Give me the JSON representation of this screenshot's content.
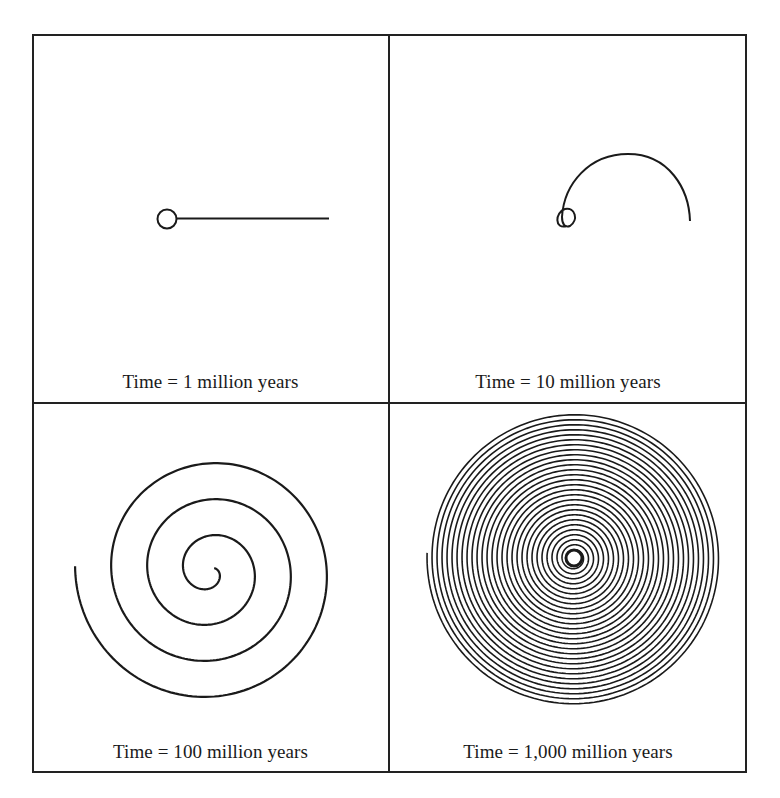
{
  "figure": {
    "panels": [
      {
        "id": "p1",
        "caption": "Time = 1 million years"
      },
      {
        "id": "p2",
        "caption": "Time = 10 million years"
      },
      {
        "id": "p3",
        "caption": "Time = 100 million years"
      },
      {
        "id": "p4",
        "caption": "Time = 1,000 million years"
      }
    ],
    "colors": {
      "line": "#1a1a1a",
      "border": "#222222",
      "background": "#ffffff"
    }
  }
}
